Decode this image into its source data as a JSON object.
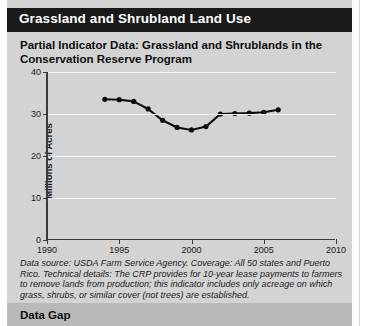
{
  "section": {
    "header_title": "Grassland and Shrubland Land Use"
  },
  "figure": {
    "title": "Partial Indicator Data: Grassland and Shrublands in the Conservation Reserve Program",
    "caption": "Data source: USDA Farm Service Agency. Coverage: All 50 states and Puerto Rico. Technical details: The CRP provides for 10-year lease payments to farmers to remove lands from production; this indicator includes only acreage on which grass, shrubs, or similar cover (not trees) are established."
  },
  "next_section": {
    "title": "Data Gap"
  },
  "colors": {
    "header_bar": "#1a1a1a",
    "header_text": "#ffffff",
    "page_background": "#d3d3d3",
    "gridline": "#f2f2f2",
    "axis": "#3c3c3c",
    "series_line": "#0d0d0d",
    "next_section_band": "#b9b9b9"
  },
  "chart_data": {
    "type": "line",
    "title": "Partial Indicator Data: Grassland and Shrublands in the Conservation Reserve Program",
    "xlabel": "",
    "ylabel": "Millions of Acres",
    "xlim": [
      1990,
      2010
    ],
    "ylim": [
      0,
      40
    ],
    "xticks": [
      1990,
      1995,
      2000,
      2005,
      2010
    ],
    "yticks": [
      0,
      10,
      20,
      30,
      40
    ],
    "xtick_labels": [
      "1990",
      "1995",
      "2000",
      "2005",
      "2010"
    ],
    "ytick_labels": [
      "0",
      "10",
      "20",
      "30",
      "40"
    ],
    "grid": "horizontal",
    "legend": "none",
    "markers": "filled-circle",
    "series": [
      {
        "name": "Grassland and shrublands in the Conservation Reserve Program",
        "x": [
          1994,
          1995,
          1996,
          1997,
          1998,
          1999,
          2000,
          2001,
          2002,
          2003,
          2004,
          2005,
          2006
        ],
        "values": [
          33.5,
          33.4,
          33.0,
          31.2,
          28.5,
          26.8,
          26.2,
          27.0,
          30.0,
          30.1,
          30.2,
          30.4,
          31.0
        ]
      }
    ]
  }
}
